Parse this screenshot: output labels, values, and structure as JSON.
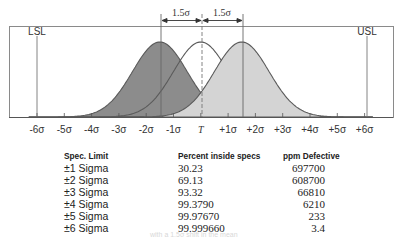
{
  "chart_data": {
    "type": "area",
    "title": "",
    "xlabel": "",
    "ylabel": "",
    "x_ticks": [
      "-6σ",
      "-5σ",
      "-4σ",
      "-3σ",
      "-2σ",
      "-1σ",
      "T",
      "+1σ",
      "+2σ",
      "+3σ",
      "+4σ",
      "+5σ",
      "+6σ"
    ],
    "xlim": [
      -6,
      6
    ],
    "spec_limits": {
      "LSL": -6,
      "USL": 6
    },
    "series": [
      {
        "name": "Distribution shifted -1.5σ",
        "mean": -1.5,
        "sd": 1,
        "fill": "#8c8c8c"
      },
      {
        "name": "Centered distribution",
        "mean": 0,
        "sd": 1,
        "fill": "#ffffff"
      },
      {
        "name": "Distribution shifted +1.5σ",
        "mean": 1.5,
        "sd": 1,
        "fill": "#d4d4d4"
      }
    ],
    "annotations": [
      "1.5σ",
      "1.5σ",
      "LSL",
      "USL"
    ],
    "grid": false,
    "table": {
      "columns": [
        "Spec. Limit",
        "Percent inside specs",
        "ppm Defective"
      ],
      "rows": [
        [
          "±1 Sigma",
          "30.23",
          "697700"
        ],
        [
          "±2 Sigma",
          "69.13",
          "608700"
        ],
        [
          "±3 Sigma",
          "93.32",
          "66810"
        ],
        [
          "±4 Sigma",
          "99.3790",
          "6210"
        ],
        [
          "±5 Sigma",
          "99.97670",
          "233"
        ],
        [
          "±6 Sigma",
          "99.999660",
          "3.4"
        ]
      ]
    }
  },
  "labels": {
    "lsl": "LSL",
    "usl": "USL",
    "shift_left": "1.5σ",
    "shift_right": "1.5σ",
    "ticks": [
      "-6σ",
      "-5σ",
      "-4σ",
      "-3σ",
      "-2σ",
      "-1σ",
      "T",
      "+1σ",
      "+2σ",
      "+3σ",
      "+4σ",
      "+5σ",
      "+6σ"
    ]
  },
  "table": {
    "headers": {
      "spec": "Spec. Limit",
      "percent": "Percent inside specs",
      "ppm": "ppm Defective"
    },
    "rows": [
      {
        "spec": "±1 Sigma",
        "percent": "30.23",
        "ppm": "697700"
      },
      {
        "spec": "±2 Sigma",
        "percent": "69.13",
        "ppm": "608700"
      },
      {
        "spec": "±3 Sigma",
        "percent": "93.32",
        "ppm": "66810"
      },
      {
        "spec": "±4 Sigma",
        "percent": "99.3790",
        "ppm": "6210"
      },
      {
        "spec": "±5 Sigma",
        "percent": "99.97670",
        "ppm": "233"
      },
      {
        "spec": "±6 Sigma",
        "percent": "99.999660",
        "ppm": "3.4"
      }
    ]
  },
  "colors": {
    "left_fill": "#8c8c8c",
    "right_fill": "#d4d4d4",
    "curve_stroke": "#5a5a5a",
    "frame": "#888888"
  },
  "caption": "with a 1.5σ shift in the mean"
}
